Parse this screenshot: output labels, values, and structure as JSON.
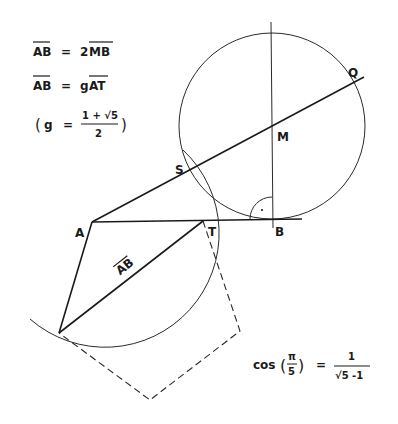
{
  "formulas": {
    "line1": {
      "lhs": "AB",
      "eq": "=",
      "coef": "2",
      "rhs": "MB"
    },
    "line2": {
      "lhs": "AB",
      "eq": "=",
      "coef": "g",
      "rhs": "AT"
    },
    "line3": {
      "open": "(",
      "var": "g",
      "eq": "=",
      "numerator": "1 + √5",
      "denominator": "2",
      "close": ")"
    },
    "cos": {
      "func": "cos",
      "arg_num": "π",
      "arg_den": "5",
      "eq": "=",
      "numerator": "1",
      "denominator": "√5 -1"
    }
  },
  "points": {
    "A": "A",
    "B": "B",
    "M": "M",
    "Q": "Q",
    "S": "S",
    "T": "T"
  },
  "segment_label": "AB",
  "colors": {
    "ink": "#1a1a1a",
    "background": "#ffffff"
  }
}
